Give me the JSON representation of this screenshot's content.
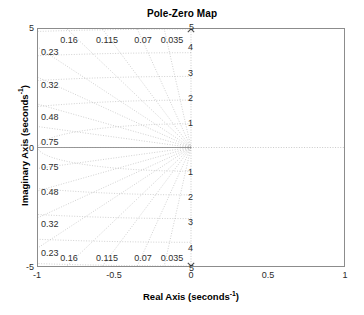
{
  "figure": {
    "title": "Pole-Zero Map",
    "background": "#ffffff",
    "box_color": "#8c8c8c",
    "grid_color": "#9a9a9a",
    "marker_color": "#4d4d4d"
  },
  "axes": {
    "x": {
      "label_text": "Real Axis (seconds",
      "label_exponent": "-1",
      "label_suffix": ")",
      "ticks": [
        "-1",
        "-0.5",
        "0",
        "0.5",
        "1"
      ],
      "tick_values": [
        -1,
        -0.5,
        0,
        0.5,
        1
      ],
      "range": [
        -1,
        1
      ]
    },
    "y": {
      "label_text": "Imaginary Axis (seconds",
      "label_exponent": "-1",
      "label_suffix": ")",
      "ticks": [
        "5",
        "0",
        "-5"
      ],
      "tick_values": [
        5,
        0,
        -5
      ],
      "range": [
        -5,
        5
      ]
    }
  },
  "chart_data": {
    "type": "scatter",
    "title": "Pole-Zero Map",
    "xlabel": "Real Axis (seconds^-1)",
    "ylabel": "Imaginary Axis (seconds^-1)",
    "xlim": [
      -1,
      1
    ],
    "ylim": [
      -5,
      5
    ],
    "grid": "sgrid",
    "legend": "none",
    "poles": [
      {
        "marker": "x",
        "real": 0,
        "imag": 5,
        "label": "pole-upper"
      },
      {
        "marker": "x",
        "real": 0,
        "imag": -5,
        "label": "pole-lower"
      }
    ],
    "zeros": [],
    "damping_ratios": [
      0.035,
      0.07,
      0.115,
      0.16,
      0.23,
      0.32,
      0.48,
      0.75
    ],
    "natural_frequencies": [
      1,
      2,
      3,
      4,
      5
    ],
    "damping_labels_top": [
      "0.16",
      "0.115",
      "0.07",
      "0.035"
    ],
    "damping_labels_left_upper": [
      "0.23",
      "0.32",
      "0.48",
      "0.75"
    ],
    "damping_labels_left_lower": [
      "0.75",
      "0.48",
      "0.32",
      "0.23"
    ],
    "damping_labels_bottom": [
      "0.16",
      "0.115",
      "0.07",
      "0.035"
    ],
    "frequency_labels_upper": [
      "4",
      "3",
      "2",
      "1"
    ],
    "frequency_labels_lower": [
      "1",
      "2",
      "3",
      "4"
    ],
    "frequency_label_axis_upper": "5",
    "frequency_label_axis_lower": "5"
  },
  "grid_notes": {
    "damping_top": [
      {
        "text": "0.16",
        "x": 69,
        "y": 36
      },
      {
        "text": "0.115",
        "x": 107,
        "y": 36
      },
      {
        "text": "0.07",
        "x": 143,
        "y": 36
      },
      {
        "text": "0.035",
        "x": 172,
        "y": 36
      }
    ],
    "damping_left_upper": [
      {
        "text": "0.23",
        "x": 41,
        "y": 48
      },
      {
        "text": "0.32",
        "x": 41,
        "y": 81
      },
      {
        "text": "0.48",
        "x": 41,
        "y": 113
      },
      {
        "text": "0.75",
        "x": 41,
        "y": 138
      }
    ],
    "damping_left_lower": [
      {
        "text": "0.75",
        "x": 41,
        "y": 163
      },
      {
        "text": "0.48",
        "x": 41,
        "y": 188
      },
      {
        "text": "0.32",
        "x": 41,
        "y": 220
      },
      {
        "text": "0.23",
        "x": 41,
        "y": 249
      }
    ],
    "damping_bottom": [
      {
        "text": "0.16",
        "x": 69,
        "y": 254
      },
      {
        "text": "0.115",
        "x": 107,
        "y": 254
      },
      {
        "text": "0.07",
        "x": 143,
        "y": 254
      },
      {
        "text": "0.035",
        "x": 172,
        "y": 254
      }
    ],
    "frequency_upper": [
      {
        "text": "4",
        "x": 193,
        "y": 47
      },
      {
        "text": "3",
        "x": 193,
        "y": 73
      },
      {
        "text": "2",
        "x": 193,
        "y": 98
      },
      {
        "text": "1",
        "x": 193,
        "y": 123
      }
    ],
    "frequency_lower": [
      {
        "text": "1",
        "x": 193,
        "y": 172
      },
      {
        "text": "2",
        "x": 193,
        "y": 197
      },
      {
        "text": "3",
        "x": 193,
        "y": 222
      },
      {
        "text": "4",
        "x": 193,
        "y": 248
      }
    ],
    "frequency_axis": [
      {
        "text": "5",
        "x": 194,
        "y": 27
      },
      {
        "text": "5",
        "x": 194,
        "y": 268
      }
    ]
  },
  "xticks": [
    {
      "text": "-1",
      "x": 37
    },
    {
      "text": "-0.5",
      "x": 114
    },
    {
      "text": "0",
      "x": 191
    },
    {
      "text": "0.5",
      "x": 268
    },
    {
      "text": "1",
      "x": 345
    }
  ],
  "yticks": [
    {
      "text": "5",
      "y": 28
    },
    {
      "text": "0",
      "y": 147.5
    },
    {
      "text": "-5",
      "y": 267
    }
  ]
}
